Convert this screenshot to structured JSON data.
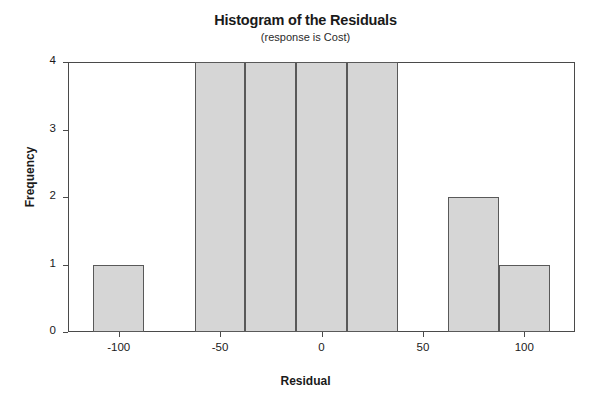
{
  "chart_data": {
    "type": "bar",
    "title": "Histogram of the Residuals",
    "subtitle": "(response is Cost)",
    "xlabel": "Residual",
    "ylabel": "Frequency",
    "grid": false,
    "legend": null,
    "xlim": [
      -125,
      125
    ],
    "ylim": [
      0,
      4
    ],
    "bin_width": 25,
    "xticks": [
      -100,
      -50,
      0,
      50,
      100
    ],
    "xtick_labels": [
      "-100",
      "-50",
      "0",
      "50",
      "100"
    ],
    "yticks": [
      0,
      1,
      2,
      3,
      4
    ],
    "ytick_labels": [
      "0",
      "1",
      "2",
      "3",
      "4"
    ],
    "bins": [
      {
        "left": -112.5,
        "right": -87.5,
        "center": -100,
        "frequency": 1
      },
      {
        "left": -62.5,
        "right": -37.5,
        "center": -50,
        "frequency": 4
      },
      {
        "left": -37.5,
        "right": -12.5,
        "center": -25,
        "frequency": 4
      },
      {
        "left": -12.5,
        "right": 12.5,
        "center": 0,
        "frequency": 4
      },
      {
        "left": 12.5,
        "right": 37.5,
        "center": 25,
        "frequency": 4
      },
      {
        "left": 62.5,
        "right": 87.5,
        "center": 75,
        "frequency": 2
      },
      {
        "left": 87.5,
        "right": 112.5,
        "center": 100,
        "frequency": 1
      }
    ],
    "categories": [
      "-100",
      "-50",
      "-25",
      "0",
      "25",
      "75",
      "100"
    ],
    "values": [
      1,
      4,
      4,
      4,
      4,
      2,
      1
    ],
    "colors": {
      "bar_fill": "#d6d6d6",
      "bar_edge": "#595959",
      "axis": "#4a4a4a",
      "text": "#1a1a1a",
      "background": "#ffffff"
    }
  }
}
